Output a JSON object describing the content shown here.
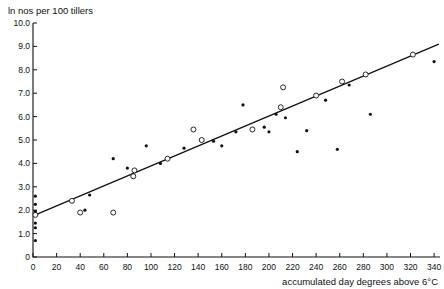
{
  "chart_data": {
    "type": "scatter",
    "title": "",
    "ylabel": "ln nos per 100 tillers",
    "xlabel": "accumulated day degrees above 6°C",
    "xlim": [
      0,
      345
    ],
    "ylim": [
      0,
      10
    ],
    "grid": false,
    "legend": "none",
    "x_ticks": [
      0,
      20,
      40,
      60,
      80,
      100,
      120,
      140,
      160,
      180,
      200,
      220,
      240,
      260,
      280,
      300,
      320,
      340
    ],
    "x_tick_labels": [
      "0",
      "20",
      "40",
      "60",
      "80",
      "100",
      "120",
      "140",
      "160",
      "180",
      "200",
      "220",
      "240",
      "260",
      "280",
      "300",
      "320",
      "340"
    ],
    "y_ticks": [
      0,
      1,
      2,
      3,
      4,
      5,
      6,
      7,
      8,
      9,
      10
    ],
    "y_tick_labels": [
      "0",
      "1.0",
      "2.0",
      "3.0",
      "4.0",
      "5.0",
      "6.0",
      "7.0",
      "8.0",
      "9.0",
      "10.0"
    ],
    "series": [
      {
        "name": "filled",
        "marker": "filled-circle",
        "points": [
          [
            2,
            0.7
          ],
          [
            2,
            1.25
          ],
          [
            2,
            1.45
          ],
          [
            2,
            1.95
          ],
          [
            2,
            2.25
          ],
          [
            2,
            2.6
          ],
          [
            44,
            2.0
          ],
          [
            48,
            2.65
          ],
          [
            68,
            4.2
          ],
          [
            80,
            3.8
          ],
          [
            96,
            4.75
          ],
          [
            108,
            4.0
          ],
          [
            128,
            4.65
          ],
          [
            153,
            4.95
          ],
          [
            160,
            4.75
          ],
          [
            172,
            5.35
          ],
          [
            178,
            6.5
          ],
          [
            196,
            5.55
          ],
          [
            200,
            5.35
          ],
          [
            206,
            6.1
          ],
          [
            214,
            5.95
          ],
          [
            224,
            4.5
          ],
          [
            232,
            5.4
          ],
          [
            248,
            6.7
          ],
          [
            258,
            4.6
          ],
          [
            268,
            7.35
          ],
          [
            286,
            6.1
          ],
          [
            340,
            8.35
          ]
        ]
      },
      {
        "name": "open",
        "marker": "open-circle",
        "points": [
          [
            2,
            1.8
          ],
          [
            33,
            2.4
          ],
          [
            40,
            1.9
          ],
          [
            68,
            1.9
          ],
          [
            85,
            3.45
          ],
          [
            86,
            3.7
          ],
          [
            114,
            4.2
          ],
          [
            136,
            5.45
          ],
          [
            143,
            5.0
          ],
          [
            186,
            5.45
          ],
          [
            210,
            6.4
          ],
          [
            212,
            7.25
          ],
          [
            240,
            6.9
          ],
          [
            262,
            7.5
          ],
          [
            282,
            7.8
          ],
          [
            322,
            8.65
          ]
        ]
      }
    ],
    "fit_line": {
      "name": "regression-line",
      "x_start": 2,
      "y_start": 1.8,
      "x_end": 344,
      "y_end": 9.1
    }
  }
}
